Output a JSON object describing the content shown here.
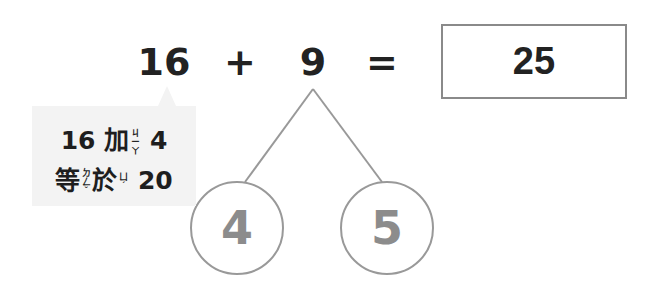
{
  "equation": {
    "left_operand": "16",
    "operator": "+",
    "right_operand": "9",
    "equals": "=",
    "answer": "25"
  },
  "hint": {
    "line1": {
      "number_a": "16",
      "word": "加",
      "bopomofo": "ㄐㄧㄚ",
      "number_b": "4"
    },
    "line2": {
      "word1": "等",
      "bopomofo1": "ㄉㄥˇ",
      "word2": "於",
      "bopomofo2": "ㄩˊ",
      "number": "20"
    }
  },
  "number_bond": {
    "whole": "9",
    "parts": [
      "4",
      "5"
    ]
  },
  "colors": {
    "text": "#222222",
    "part_numbers": "#8c8c8c",
    "lines": "#999999",
    "box_border": "#8a8a8a",
    "hint_background": "#f3f3f3"
  }
}
